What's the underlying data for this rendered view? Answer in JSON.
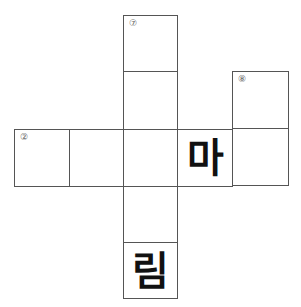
{
  "puzzle": {
    "cells": [
      {
        "id": "c7a",
        "x": 123,
        "y": 15,
        "w": 55,
        "h": 57,
        "number": "⑦",
        "letter": ""
      },
      {
        "id": "c7b",
        "x": 123,
        "y": 71,
        "w": 55,
        "h": 59,
        "number": "",
        "letter": ""
      },
      {
        "id": "c8a",
        "x": 232,
        "y": 71,
        "w": 57,
        "h": 58,
        "number": "⑧",
        "letter": ""
      },
      {
        "id": "r1",
        "x": 14,
        "y": 129,
        "w": 56,
        "h": 58,
        "number": "②",
        "letter": ""
      },
      {
        "id": "r2",
        "x": 69,
        "y": 129,
        "w": 55,
        "h": 58,
        "number": "",
        "letter": ""
      },
      {
        "id": "r3",
        "x": 123,
        "y": 129,
        "w": 55,
        "h": 58,
        "number": "",
        "letter": ""
      },
      {
        "id": "r4",
        "x": 177,
        "y": 129,
        "w": 56,
        "h": 58,
        "number": "",
        "letter": "마"
      },
      {
        "id": "r5",
        "x": 232,
        "y": 128,
        "w": 57,
        "h": 58,
        "number": "",
        "letter": ""
      },
      {
        "id": "d1",
        "x": 123,
        "y": 186,
        "w": 55,
        "h": 57,
        "number": "",
        "letter": ""
      },
      {
        "id": "d2",
        "x": 123,
        "y": 242,
        "w": 55,
        "h": 57,
        "number": "",
        "letter": "림"
      }
    ]
  },
  "colors": {
    "border": "#555555",
    "number": "#666666",
    "letter": "#111111",
    "background": "#ffffff"
  }
}
